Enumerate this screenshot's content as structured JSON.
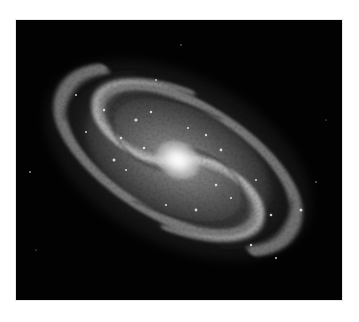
{
  "image": {
    "subject": "spiral galaxy",
    "description": "Grayscale photograph of a face-on tilted spiral galaxy with bright central bulge and mottled spiral arms on a black sky background",
    "colors": {
      "page_background": "#ffffff",
      "sky_background": "#020202",
      "core": "#ffffff",
      "arms": "#9a9a9a",
      "dust_lanes": "#2a2a2a"
    },
    "frame": {
      "x": 16,
      "y": 20,
      "width": 326,
      "height": 280
    },
    "galaxy": {
      "center_x": 162,
      "center_y": 140,
      "rotation_deg": 28,
      "major_axis_px": 290,
      "minor_axis_px": 170
    }
  }
}
